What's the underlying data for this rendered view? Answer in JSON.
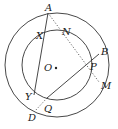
{
  "diagram": {
    "type": "geometry",
    "stroke_color": "#333333",
    "center": {
      "label": "O",
      "x": 55,
      "y": 67
    },
    "outer_circle": {
      "cx": 57,
      "cy": 65,
      "r": 52
    },
    "inner_circle": {
      "cx": 57,
      "cy": 65,
      "r": 35
    },
    "points": {
      "A": {
        "label": "A",
        "x": 48,
        "y": 13
      },
      "X": {
        "label": "X",
        "x": 44,
        "y": 37
      },
      "N": {
        "label": "N",
        "x": 68,
        "y": 33
      },
      "B": {
        "label": "B",
        "x": 99,
        "y": 53
      },
      "P": {
        "label": "P",
        "x": 89,
        "y": 66
      },
      "M": {
        "label": "M",
        "x": 100,
        "y": 84
      },
      "Y": {
        "label": "Y",
        "x": 35,
        "y": 90
      },
      "Q": {
        "label": "Q",
        "x": 49,
        "y": 100
      },
      "D": {
        "label": "D",
        "x": 34,
        "y": 115
      }
    },
    "segments": [
      {
        "from": "A",
        "to": "Y",
        "style": "solid"
      },
      {
        "from": "Q",
        "to": "B",
        "style": "solid"
      },
      {
        "from": "A",
        "to": "M",
        "style": "dotted"
      },
      {
        "from": "Q",
        "to": "D",
        "style": "dotted"
      }
    ]
  }
}
